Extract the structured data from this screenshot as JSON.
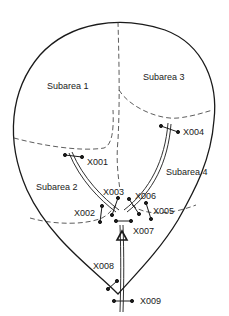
{
  "diagram": {
    "subareas": [
      {
        "id": "sub1",
        "label": "Subarea 1"
      },
      {
        "id": "sub2",
        "label": "Subarea 2"
      },
      {
        "id": "sub3",
        "label": "Subarea 3"
      },
      {
        "id": "sub4",
        "label": "Subarea 4"
      }
    ],
    "stations": [
      {
        "id": "x001",
        "label": "X001"
      },
      {
        "id": "x002",
        "label": "X002"
      },
      {
        "id": "x003",
        "label": "X003"
      },
      {
        "id": "x004",
        "label": "X004"
      },
      {
        "id": "x005",
        "label": "X005"
      },
      {
        "id": "x006",
        "label": "X006"
      },
      {
        "id": "x007",
        "label": "X007"
      },
      {
        "id": "x008",
        "label": "X008"
      },
      {
        "id": "x009",
        "label": "X009"
      }
    ],
    "outlet_symbol": "triangle-icon",
    "colors": {
      "line": "#1a1a1a",
      "background": "#ffffff"
    }
  }
}
